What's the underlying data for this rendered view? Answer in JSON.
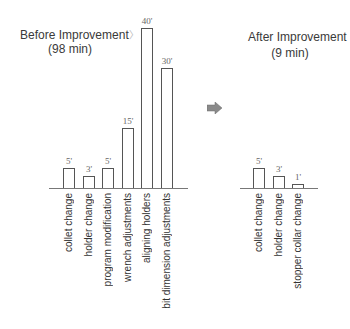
{
  "chart_data": [
    {
      "type": "bar",
      "title": "Before Improvement",
      "subtitle": "(98 min)",
      "categories": [
        "collet change",
        "holder change",
        "program modification",
        "wrench adjustments",
        "aligning holders",
        "bit dimension adjustments"
      ],
      "values": [
        5,
        3,
        5,
        15,
        40,
        30
      ],
      "value_labels": [
        "5'",
        "3'",
        "5'",
        "15'",
        "40'",
        "30'"
      ],
      "unit": "min",
      "xlabel": "",
      "ylabel": "",
      "ylim": [
        0,
        40
      ],
      "grid": false,
      "legend": null
    },
    {
      "type": "bar",
      "title": "After Improvement",
      "subtitle": "(9 min)",
      "categories": [
        "collet change",
        "holder change",
        "stopper collar change"
      ],
      "values": [
        5,
        3,
        1
      ],
      "value_labels": [
        "5'",
        "3'",
        "1'"
      ],
      "unit": "min",
      "xlabel": "",
      "ylabel": "",
      "ylim": [
        0,
        40
      ],
      "grid": false,
      "legend": null
    }
  ],
  "before": {
    "title": "Before Improvement",
    "title_suffix": "〉",
    "subtitle": "(98 min)"
  },
  "after": {
    "title": "After Improvement",
    "subtitle": "(9 min)"
  },
  "transition_icon": "right-arrow-icon",
  "colors": {
    "bar_stroke": "#555555",
    "axis": "#777777",
    "arrow": "#8a8a8a",
    "text": "#333333"
  }
}
